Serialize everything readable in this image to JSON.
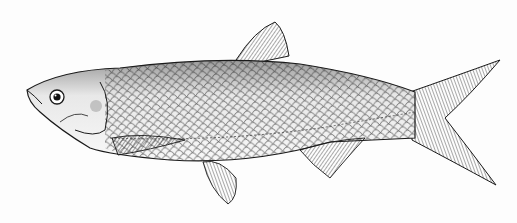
{
  "image": {
    "subject": "fish",
    "style": "black and white engraved scientific illustration",
    "orientation": "facing left",
    "colors": {
      "background": "#fdfdfd",
      "ink": "#1a1a1a",
      "body_fill": "#f4f4f4",
      "shading": "#6a6a6a"
    }
  }
}
